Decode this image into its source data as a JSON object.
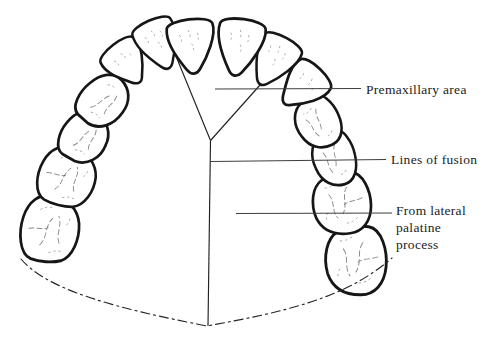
{
  "diagram": {
    "name": "palate-development-diagram",
    "background": "#ffffff",
    "ink": "#161616",
    "leader_color": "#3d3d3d",
    "labels": {
      "premaxillary": {
        "text": "Premaxillary area"
      },
      "fusion": {
        "text": "Lines of fusion"
      },
      "palatine": {
        "text": "From lateral palatine process"
      }
    },
    "teeth": [
      {
        "name": "left-second-molar",
        "type": "molar",
        "x": 50,
        "y": 229,
        "rot": -82,
        "sx": 1.07,
        "sy": 1.0
      },
      {
        "name": "left-first-molar",
        "type": "molar",
        "x": 67,
        "y": 177,
        "rot": -72,
        "sx": 0.95,
        "sy": 0.98
      },
      {
        "name": "left-second-premolar",
        "type": "premolar",
        "x": 85,
        "y": 137,
        "rot": -60,
        "sx": 1.0,
        "sy": 1.0
      },
      {
        "name": "left-first-premolar",
        "type": "premolar",
        "x": 104,
        "y": 101,
        "rot": -48,
        "sx": 1.05,
        "sy": 0.98
      },
      {
        "name": "left-canine",
        "type": "canine",
        "x": 127,
        "y": 63,
        "rot": -38,
        "sx": 0.98,
        "sy": 0.92
      },
      {
        "name": "left-lateral-incisor",
        "type": "incisor",
        "x": 159,
        "y": 44,
        "rot": -24,
        "sx": 0.9,
        "sy": 0.95
      },
      {
        "name": "right-second-molar",
        "type": "molar",
        "x": 356,
        "y": 261,
        "rot": 85,
        "sx": 1.1,
        "sy": 1.05
      },
      {
        "name": "right-first-molar",
        "type": "molar",
        "x": 342,
        "y": 204,
        "rot": 78,
        "sx": 0.98,
        "sy": 1.0
      },
      {
        "name": "right-second-premolar",
        "type": "premolar",
        "x": 334,
        "y": 159,
        "rot": 70,
        "sx": 1.05,
        "sy": 0.92
      },
      {
        "name": "right-first-premolar",
        "type": "premolar",
        "x": 318,
        "y": 123,
        "rot": 58,
        "sx": 1.0,
        "sy": 0.95
      },
      {
        "name": "right-canine",
        "type": "canine",
        "x": 303,
        "y": 87,
        "rot": 44,
        "sx": 1.0,
        "sy": 1.0
      },
      {
        "name": "right-lateral-incisor",
        "type": "incisor",
        "x": 274,
        "y": 61,
        "rot": 28,
        "sx": 0.92,
        "sy": 0.98
      },
      {
        "name": "left-central-incisor",
        "type": "incisor",
        "x": 192,
        "y": 46,
        "rot": -7,
        "sx": 1.0,
        "sy": 1.0
      },
      {
        "name": "right-central-incisor",
        "type": "incisor",
        "x": 240,
        "y": 47,
        "rot": 8,
        "sx": 1.0,
        "sy": 1.05
      }
    ],
    "fusion_lines": [
      {
        "name": "left-incisive-suture",
        "x1": 171,
        "y1": 44,
        "x2": 210.5,
        "y2": 140.5
      },
      {
        "name": "right-incisive-suture",
        "x1": 277,
        "y1": 66,
        "x2": 210.5,
        "y2": 140.5
      },
      {
        "name": "median-palatine-suture",
        "x1": 210.5,
        "y1": 140.5,
        "x2": 208,
        "y2": 326
      }
    ],
    "leaders": [
      {
        "name": "premaxillary-leader",
        "x1": 215,
        "y1": 89,
        "x2": 361,
        "y2": 88.5
      },
      {
        "name": "fusion-leader",
        "x1": 211,
        "y1": 161.5,
        "x2": 386,
        "y2": 159.5
      },
      {
        "name": "palatine-leader",
        "x1": 236,
        "y1": 213.5,
        "x2": 392,
        "y2": 213
      }
    ],
    "posterior_border": {
      "name": "posterior-palate-border",
      "path": "M 21 259 C 48 291 120 309 207 326 C 283 312 345 299 392 258"
    }
  }
}
